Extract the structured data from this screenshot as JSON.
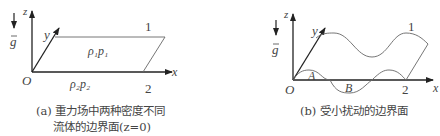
{
  "panel_a": {
    "axes": {
      "z": "z",
      "y": "y",
      "x": "x",
      "origin": "O"
    },
    "gravity": "g",
    "upper_label": "ρ₁p₁",
    "lower_label": "ρ₂p₂",
    "fluid1": "1",
    "fluid2": "2",
    "caption_line1": "(a) 重力场中两种密度不同",
    "caption_line2": "流体的边界面(z=0)"
  },
  "panel_b": {
    "axes": {
      "z": "z",
      "y": "y",
      "x": "x",
      "origin": "O"
    },
    "gravity": "g",
    "point_a": "A",
    "point_b": "B",
    "fluid1": "1",
    "fluid2": "2",
    "caption": "(b) 受小扰动的边界面"
  },
  "colors": {
    "axis": "#222222",
    "line": "#555555",
    "text": "#444444"
  }
}
